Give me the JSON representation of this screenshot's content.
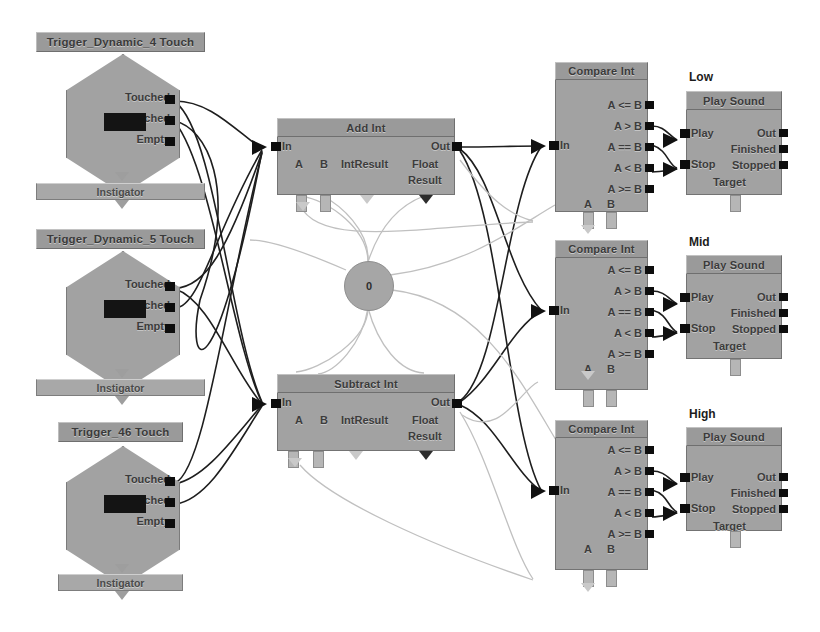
{
  "graph": {
    "title": "Kismet Sequence",
    "bg_color": "#ffffff",
    "node_color": "#a2a2a2",
    "title_color": "#9a9a9a",
    "wire_color": "#1e1e1e",
    "variable_wire_color": "#c0c0c0"
  },
  "events": [
    {
      "title": "Trigger_Dynamic_4 Touch",
      "outputs": [
        "Touched",
        "UnTouched",
        "Empty"
      ],
      "instigator_label": "Instigator"
    },
    {
      "title": "Trigger_Dynamic_5 Touch",
      "outputs": [
        "Touched",
        "UnTouched",
        "Empty"
      ],
      "instigator_label": "Instigator"
    },
    {
      "title": "Trigger_46 Touch",
      "outputs": [
        "Touched",
        "UnTouched",
        "Empty"
      ],
      "instigator_label": "Instigator"
    }
  ],
  "math_nodes": [
    {
      "title": "Add Int",
      "in_label": "In",
      "out_label": "Out",
      "var_a": "A",
      "var_b": "B",
      "int_result": "IntResult",
      "float_result_line1": "Float",
      "float_result_line2": "Result"
    },
    {
      "title": "Subtract Int",
      "in_label": "In",
      "out_label": "Out",
      "var_a": "A",
      "var_b": "B",
      "int_result": "IntResult",
      "float_result_line1": "Float",
      "float_result_line2": "Result"
    }
  ],
  "int_variable": {
    "value": "0"
  },
  "compare_nodes": [
    {
      "title": "Compare Int",
      "in_label": "In",
      "outputs": [
        "A <= B",
        "A > B",
        "A == B",
        "A < B",
        "A >= B"
      ],
      "var_a": "A",
      "var_b": "B"
    },
    {
      "title": "Compare Int",
      "in_label": "In",
      "outputs": [
        "A <= B",
        "A > B",
        "A == B",
        "A < B",
        "A >= B"
      ],
      "var_a": "A",
      "var_b": "B"
    },
    {
      "title": "Compare Int",
      "in_label": "In",
      "outputs": [
        "A <= B",
        "A > B",
        "A == B",
        "A < B",
        "A >= B"
      ],
      "var_a": "A",
      "var_b": "B"
    }
  ],
  "sound_nodes": [
    {
      "group_label": "Low",
      "title": "Play Sound",
      "inputs": [
        "Play",
        "Stop"
      ],
      "outputs": [
        "Out",
        "Finished",
        "Stopped"
      ],
      "target_label": "Target"
    },
    {
      "group_label": "Mid",
      "title": "Play Sound",
      "inputs": [
        "Play",
        "Stop"
      ],
      "outputs": [
        "Out",
        "Finished",
        "Stopped"
      ],
      "target_label": "Target"
    },
    {
      "group_label": "High",
      "title": "Play Sound",
      "inputs": [
        "Play",
        "Stop"
      ],
      "outputs": [
        "Out",
        "Finished",
        "Stopped"
      ],
      "target_label": "Target"
    }
  ]
}
